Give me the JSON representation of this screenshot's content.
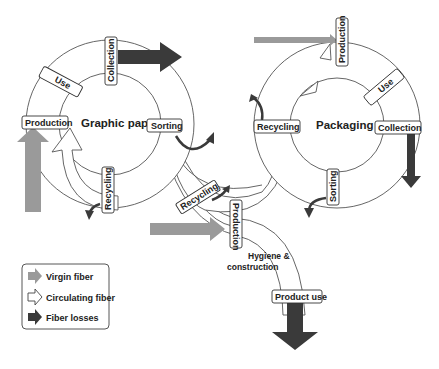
{
  "diagram": {
    "cycles": [
      {
        "name": "Graphic papers",
        "stages": [
          "Production",
          "Use",
          "Collection",
          "Sorting",
          "Recycling"
        ]
      },
      {
        "name": "Packaging",
        "stages": [
          "Production",
          "Use",
          "Collection",
          "Sorting",
          "Recycling"
        ]
      },
      {
        "name": "Hygiene & construction",
        "stages": [
          "Recycling",
          "Production",
          "Product use"
        ]
      }
    ],
    "labels": {
      "gp_title": "Graphic papers",
      "gp_production": "Production",
      "gp_use": "Use",
      "gp_collection": "Collection",
      "gp_sorting": "Sorting",
      "gp_recycling": "Recycling",
      "pk_title": "Packaging",
      "pk_production": "Production",
      "pk_use": "Use",
      "pk_collection": "Collection",
      "pk_sorting": "Sorting",
      "pk_recycling": "Recycling",
      "hc_title_line1": "Hygiene &",
      "hc_title_line2": "construction",
      "hc_recycling": "Recycling",
      "hc_production": "Production",
      "hc_product_use": "Product use"
    }
  },
  "legend": {
    "items": [
      {
        "label": "Virgin fiber",
        "color": "#9a9a9a",
        "icon": "arrow-gray-icon"
      },
      {
        "label": "Circulating fiber",
        "color": "#ffffff",
        "icon": "arrow-outline-icon"
      },
      {
        "label": "Fiber losses",
        "color": "#3a3a3a",
        "icon": "arrow-dark-icon"
      }
    ]
  },
  "colors": {
    "virgin": "#9a9a9a",
    "circulating": "#ffffff",
    "losses": "#3a3a3a",
    "stroke": "#555555"
  }
}
